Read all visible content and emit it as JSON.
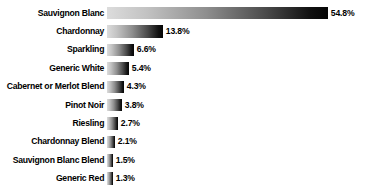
{
  "chart_data": {
    "type": "bar",
    "orientation": "horizontal",
    "title": "",
    "subtitle": "",
    "xlabel": "",
    "ylabel": "",
    "grid": false,
    "legend": false,
    "xlim": [
      0,
      54.8
    ],
    "units": "%",
    "categories": [
      "Sauvignon Blanc",
      "Chardonnay",
      "Sparkling",
      "Generic White",
      "Cabernet or Merlot Blend",
      "Pinot Noir",
      "Riesling",
      "Chardonnay Blend",
      "Sauvignon Blanc Blend",
      "Generic Red"
    ],
    "values": [
      54.8,
      13.8,
      6.6,
      5.4,
      4.3,
      3.8,
      2.7,
      2.1,
      1.5,
      1.3
    ],
    "value_labels": [
      "54.8%",
      "13.8%",
      "6.6%",
      "5.4%",
      "4.3%",
      "3.8%",
      "2.7%",
      "2.1%",
      "1.5%",
      "1.3%"
    ],
    "bar_gradient": {
      "from": "#dcdcdc",
      "to": "#050505",
      "direction": "left-to-right"
    },
    "scale_px_per_percent": 4.03,
    "min_bar_px": 6,
    "background_color": "#ffffff",
    "text_color": "#000000"
  }
}
